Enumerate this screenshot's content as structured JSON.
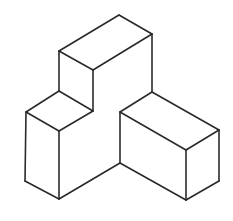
{
  "figure": {
    "title": "",
    "stroke_color": "#2a2a2a",
    "background": "#ffffff",
    "edges": [
      [
        119,
        15,
        152,
        34
      ],
      [
        119,
        15,
        59,
        51
      ],
      [
        59,
        51,
        93,
        70
      ],
      [
        93,
        70,
        152,
        34
      ],
      [
        59,
        51,
        59,
        91
      ],
      [
        93,
        70,
        93,
        111
      ],
      [
        152,
        34,
        152,
        92
      ],
      [
        59,
        91,
        26,
        112
      ],
      [
        59,
        91,
        93,
        111
      ],
      [
        26,
        112,
        59,
        131
      ],
      [
        59,
        131,
        93,
        111
      ],
      [
        26,
        112,
        25,
        181
      ],
      [
        59,
        131,
        59,
        199
      ],
      [
        25,
        181,
        59,
        199
      ],
      [
        59,
        199,
        120,
        163
      ],
      [
        152,
        92,
        120,
        112
      ],
      [
        152,
        92,
        219,
        130
      ],
      [
        120,
        112,
        186,
        150
      ],
      [
        186,
        150,
        219,
        130
      ],
      [
        120,
        112,
        120,
        163
      ],
      [
        186,
        150,
        186,
        200
      ],
      [
        219,
        130,
        219,
        181
      ],
      [
        120,
        163,
        186,
        200
      ],
      [
        186,
        200,
        219,
        181
      ]
    ]
  }
}
